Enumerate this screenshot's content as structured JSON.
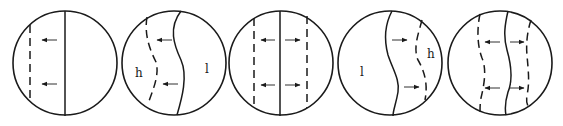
{
  "figure": {
    "panels": [
      {
        "id": 1,
        "labels": {}
      },
      {
        "id": 2,
        "labels": {
          "left": "h",
          "right": "l"
        }
      },
      {
        "id": 3,
        "labels": {}
      },
      {
        "id": 4,
        "labels": {
          "left": "l",
          "right": "h"
        }
      },
      {
        "id": 5,
        "labels": {}
      }
    ]
  },
  "colors": {
    "stroke": "#1a1a1a",
    "background": "#ffffff"
  }
}
